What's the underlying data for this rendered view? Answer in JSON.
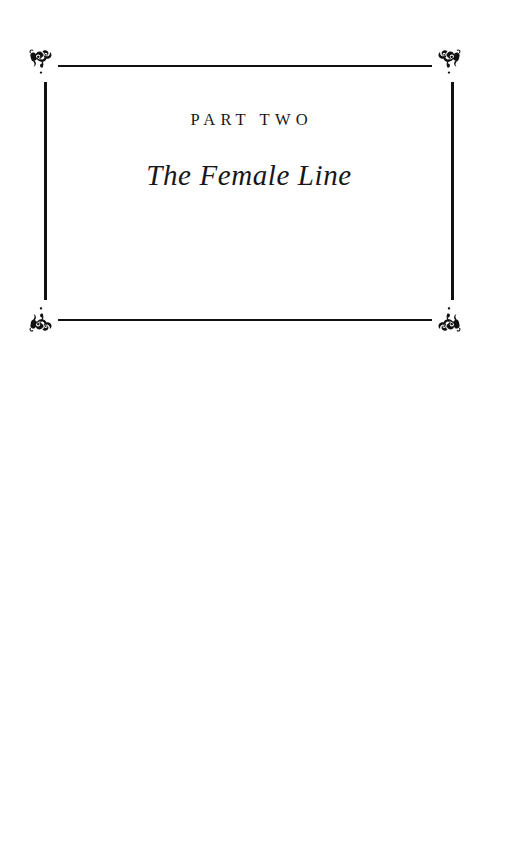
{
  "page": {
    "kind": "book-part-title-page",
    "background_color": "#ffffff",
    "ink_color": "#111111",
    "width": 510,
    "height": 851
  },
  "frame": {
    "rules": [
      {
        "name": "top-rule",
        "orientation": "horizontal"
      },
      {
        "name": "bottom-rule",
        "orientation": "horizontal"
      },
      {
        "name": "left-rule",
        "orientation": "vertical"
      },
      {
        "name": "right-rule",
        "orientation": "vertical"
      }
    ],
    "ornaments": [
      {
        "name": "corner-ornament-top-left",
        "icon": "floral-scrollwork-ornament-icon"
      },
      {
        "name": "corner-ornament-top-right",
        "icon": "floral-scrollwork-ornament-icon"
      },
      {
        "name": "corner-ornament-bottom-left",
        "icon": "floral-scrollwork-ornament-icon"
      },
      {
        "name": "corner-ornament-bottom-right",
        "icon": "floral-scrollwork-ornament-icon"
      }
    ]
  },
  "content": {
    "part_label": "PART TWO",
    "part_title": "The Female Line"
  }
}
